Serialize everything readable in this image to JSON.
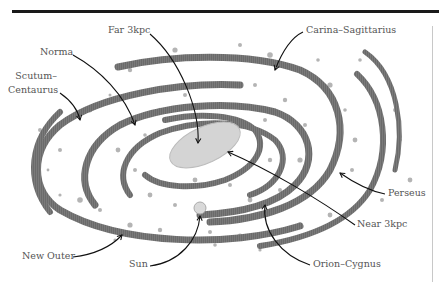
{
  "diagram": {
    "colors": {
      "arm": "#6e6e6e",
      "dot": "#9a9a9a",
      "bar": "#d6d6d6",
      "sun": "#d9d9d9",
      "label": "#555555",
      "arrow": "#111111",
      "rule": "#1a1a1a"
    },
    "labels": {
      "far_3kpc": "Far 3kpc",
      "carina_sagittarius": "Carina–Sagittarius",
      "norma": "Norma",
      "scutum_centaurus_1": "Scutum–",
      "scutum_centaurus_2": "Centaurus",
      "new_outer": "New Outer",
      "sun": "Sun",
      "perseus": "Perseus",
      "near_3kpc": "Near 3kpc",
      "orion_cygnus": "Orion–Cygnus"
    }
  }
}
